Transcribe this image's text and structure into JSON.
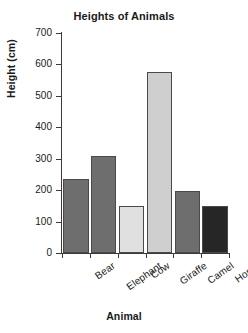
{
  "chart_data": {
    "type": "bar",
    "title": "Heights of Animals",
    "xlabel": "Animal",
    "ylabel": "Height (cm)",
    "categories": [
      "Bear",
      "Elephant",
      "Cow",
      "Giraffe",
      "Camel",
      "Horse"
    ],
    "values": [
      235,
      310,
      148,
      575,
      197,
      150
    ],
    "bar_colors": [
      "#6e6e6e",
      "#6e6e6e",
      "#e0e0e0",
      "#cfcfcf",
      "#6e6e6e",
      "#262626"
    ],
    "bar_edge_color": "#4a4a4a",
    "ylim": [
      0,
      700
    ],
    "ytick_labels": [
      "0",
      "100",
      "200",
      "300",
      "400",
      "500",
      "600",
      "700"
    ],
    "ytick_values": [
      0,
      100,
      200,
      300,
      400,
      500,
      600,
      700
    ],
    "grid": false,
    "legend": "none",
    "axis_color": "#3a3a3a",
    "background": "#ffffff",
    "xtick_label_rotation": -35
  }
}
